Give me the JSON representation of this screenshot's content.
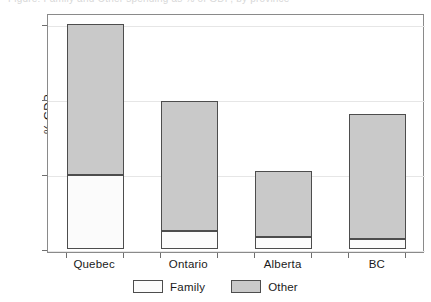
{
  "caption": {
    "text": "Figure: Family and Other spending as % of GDP, by province"
  },
  "axes": {
    "ylabel": "% GDP",
    "yticks": [
      "0",
      "2",
      "4",
      "6"
    ],
    "ytick_values": [
      0,
      2,
      4,
      6
    ]
  },
  "legend": {
    "items": [
      {
        "label": "Family",
        "color": "#fbfbfb"
      },
      {
        "label": "Other",
        "color": "#c9c9c9"
      }
    ]
  },
  "chart_data": {
    "type": "bar",
    "stacked": true,
    "title": "",
    "xlabel": "",
    "ylabel": "% GDP",
    "ylim": [
      0,
      6.4
    ],
    "yticks": [
      0,
      2,
      4,
      6
    ],
    "grid": true,
    "legend_position": "bottom",
    "categories": [
      "Quebec",
      "Ontario",
      "Alberta",
      "BC"
    ],
    "series": [
      {
        "name": "Family",
        "color": "#fbfbfb",
        "values": [
          1.97,
          0.48,
          0.32,
          0.27
        ]
      },
      {
        "name": "Other",
        "color": "#c9c9c9",
        "values": [
          4.03,
          3.47,
          1.76,
          3.33
        ]
      }
    ],
    "totals": [
      6.0,
      3.95,
      2.08,
      3.6
    ]
  },
  "bars": [
    {
      "category": "Quebec",
      "family": 1.97,
      "other": 4.03,
      "total": 6.0
    },
    {
      "category": "Ontario",
      "family": 0.48,
      "other": 3.47,
      "total": 3.95
    },
    {
      "category": "Alberta",
      "family": 0.32,
      "other": 1.76,
      "total": 2.08
    },
    {
      "category": "BC",
      "family": 0.27,
      "other": 3.33,
      "total": 3.6
    }
  ]
}
